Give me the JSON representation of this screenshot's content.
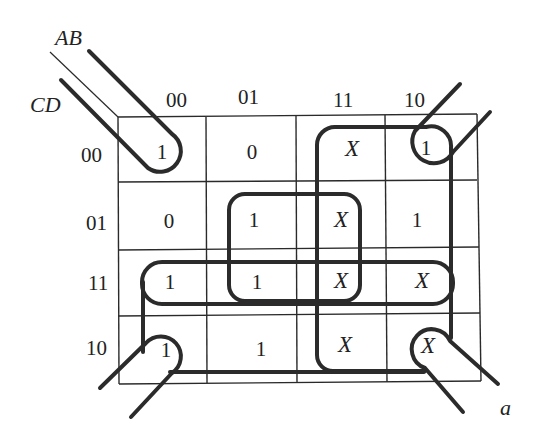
{
  "diagram": {
    "type": "karnaugh-map",
    "row_variables": "CD",
    "col_variables": "AB",
    "caption": "a",
    "col_headers": [
      "00",
      "01",
      "11",
      "10"
    ],
    "row_headers": [
      "00",
      "01",
      "11",
      "10"
    ],
    "cells": [
      [
        "1",
        "0",
        "X",
        "1"
      ],
      [
        "0",
        "1",
        "X",
        "1"
      ],
      [
        "1",
        "1",
        "X",
        "X"
      ],
      [
        "1",
        "1",
        "X",
        "X"
      ]
    ],
    "groupings": [
      {
        "name": "corners",
        "cells": [
          "00-00",
          "00-10",
          "10-00",
          "10-10"
        ]
      },
      {
        "name": "bottom-rows-outer",
        "description": "rows 11 and 10 spanning columns 00 through 10 (wraps)"
      },
      {
        "name": "row-11",
        "description": "entire row CD=11"
      },
      {
        "name": "center-square",
        "cells": [
          "01-01",
          "01-11",
          "11-01",
          "11-11"
        ]
      },
      {
        "name": "col-11-10-block",
        "description": "columns AB=11 and AB=10, all rows"
      }
    ]
  }
}
